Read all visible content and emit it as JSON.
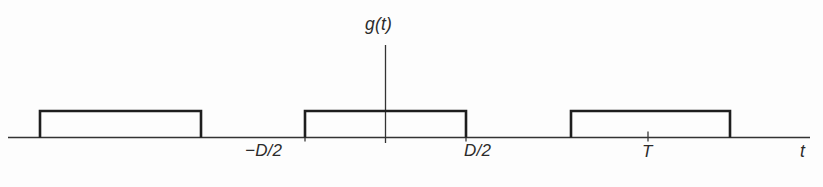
{
  "figure": {
    "kind": "line-plot",
    "background_color": "#fdfdfd",
    "stroke_color": "#1e1e1e",
    "axis_color": "#333333"
  },
  "labels": {
    "vertical_axis": "g(t)",
    "horizontal_axis": "t",
    "tick_neg_half_D": "−D/2",
    "tick_half_D": "D/2",
    "tick_period": "T"
  },
  "chart_data": {
    "type": "line",
    "title": "",
    "subtitle": "",
    "xlabel": "t",
    "ylabel": "g(t)",
    "grid": false,
    "legend": "none",
    "x_axis": {
      "baseline_y_px": 137.5,
      "start_px": 8,
      "end_px": 810,
      "arrowhead": false
    },
    "y_axis": {
      "x_px": 385.5,
      "top_px": 45,
      "bottom_px": 143,
      "arrowhead": false
    },
    "annotations": [
      {
        "text": "g(t)",
        "x_px": 385,
        "y_px": 25,
        "role": "axis-name"
      },
      {
        "text": "−D/2",
        "x_px": 275,
        "y_px": 152,
        "role": "tick-label"
      },
      {
        "text": "D/2",
        "x_px": 487,
        "y_px": 152,
        "role": "tick-label"
      },
      {
        "text": "T",
        "x_px": 649,
        "y_px": 153,
        "role": "tick-label"
      },
      {
        "text": "t",
        "x_px": 806,
        "y_px": 152,
        "role": "axis-name"
      }
    ],
    "ticks": [
      {
        "label": "−D/2",
        "x_px": 305
      },
      {
        "label": "D/2",
        "x_px": 466
      },
      {
        "label": "T",
        "x_px": 648
      }
    ],
    "pulses": [
      {
        "name": "pulse-left",
        "x_start_px": 40,
        "x_end_px": 201,
        "top_px": 111,
        "amplitude": 1
      },
      {
        "name": "pulse-center",
        "x_start_px": 305,
        "x_end_px": 466,
        "top_px": 111,
        "amplitude": 1
      },
      {
        "name": "pulse-right",
        "x_start_px": 571,
        "x_end_px": 730,
        "top_px": 111,
        "amplitude": 1
      }
    ],
    "series": [
      {
        "name": "g(t)",
        "points": [
          [
            8,
            0
          ],
          [
            40,
            0
          ],
          [
            40,
            1
          ],
          [
            201,
            1
          ],
          [
            201,
            0
          ],
          [
            305,
            0
          ],
          [
            305,
            1
          ],
          [
            466,
            1
          ],
          [
            466,
            0
          ],
          [
            571,
            0
          ],
          [
            571,
            1
          ],
          [
            730,
            1
          ],
          [
            730,
            0
          ],
          [
            810,
            0
          ]
        ],
        "note": "x values in pixel coordinates; y is normalized amplitude (0 or 1)"
      }
    ],
    "xlim_px": [
      0,
      823
    ],
    "ylim": [
      0,
      1.2
    ]
  }
}
